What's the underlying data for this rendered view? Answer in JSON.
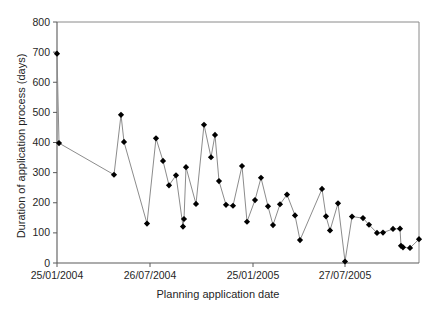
{
  "chart_data": {
    "type": "line",
    "title": "",
    "xlabel": "Planning application date",
    "ylabel": "Duration of application process (days)",
    "ylim": [
      0,
      800
    ],
    "yticks": [
      0,
      100,
      200,
      300,
      400,
      500,
      600,
      700,
      800
    ],
    "xticks": [
      "25/01/2004",
      "26/07/2004",
      "25/01/2005",
      "27/07/2005"
    ],
    "xtick_positions_px": [
      57,
      150,
      253,
      345
    ],
    "grid": false,
    "legend": false,
    "marker": "diamond",
    "marker_color": "#000000",
    "line_color": "#808080",
    "series": [
      {
        "name": "Duration of application process",
        "points": [
          {
            "x": 57,
            "y": 695
          },
          {
            "x": 59,
            "y": 398
          },
          {
            "x": 114,
            "y": 293
          },
          {
            "x": 121,
            "y": 492
          },
          {
            "x": 124,
            "y": 402
          },
          {
            "x": 147,
            "y": 131
          },
          {
            "x": 156,
            "y": 414
          },
          {
            "x": 163,
            "y": 339
          },
          {
            "x": 169,
            "y": 258
          },
          {
            "x": 176,
            "y": 291
          },
          {
            "x": 183,
            "y": 121
          },
          {
            "x": 184,
            "y": 146
          },
          {
            "x": 186,
            "y": 318
          },
          {
            "x": 196,
            "y": 196
          },
          {
            "x": 204,
            "y": 459
          },
          {
            "x": 211,
            "y": 351
          },
          {
            "x": 215,
            "y": 425
          },
          {
            "x": 219,
            "y": 272
          },
          {
            "x": 226,
            "y": 193
          },
          {
            "x": 233,
            "y": 190
          },
          {
            "x": 242,
            "y": 322
          },
          {
            "x": 247,
            "y": 137
          },
          {
            "x": 255,
            "y": 209
          },
          {
            "x": 261,
            "y": 283
          },
          {
            "x": 268,
            "y": 188
          },
          {
            "x": 273,
            "y": 126
          },
          {
            "x": 280,
            "y": 195
          },
          {
            "x": 287,
            "y": 227
          },
          {
            "x": 295,
            "y": 158
          },
          {
            "x": 300,
            "y": 76
          },
          {
            "x": 322,
            "y": 246
          },
          {
            "x": 326,
            "y": 155
          },
          {
            "x": 330,
            "y": 108
          },
          {
            "x": 338,
            "y": 198
          },
          {
            "x": 345,
            "y": 5
          },
          {
            "x": 352,
            "y": 154
          },
          {
            "x": 363,
            "y": 149
          },
          {
            "x": 369,
            "y": 127
          },
          {
            "x": 377,
            "y": 100
          },
          {
            "x": 383,
            "y": 101
          },
          {
            "x": 393,
            "y": 113
          },
          {
            "x": 400,
            "y": 114
          },
          {
            "x": 401,
            "y": 57
          },
          {
            "x": 403,
            "y": 52
          },
          {
            "x": 410,
            "y": 50
          },
          {
            "x": 419,
            "y": 79
          }
        ]
      }
    ]
  },
  "axes": {
    "y_axis_name": "duration-days",
    "x_axis_name": "planning-application-date"
  }
}
